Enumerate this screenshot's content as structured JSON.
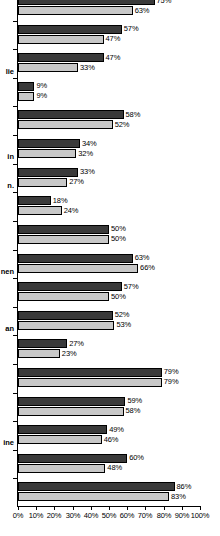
{
  "chart_data": {
    "type": "bar",
    "orientation": "horizontal",
    "title": "",
    "subtitle": "",
    "xlabel": "",
    "ylabel": "",
    "xlim": [
      0,
      100
    ],
    "xticks": [
      0,
      10,
      20,
      30,
      40,
      50,
      60,
      70,
      80,
      90,
      100
    ],
    "xtick_labels": [
      "0%",
      "10%",
      "20%",
      "30%",
      "40%",
      "50%",
      "60%",
      "70%",
      "80%",
      "90%",
      "100%"
    ],
    "grid": false,
    "legend": null,
    "value_label_suffix": "%",
    "colors": {
      "series_0": "#3a3a3a",
      "series_1": "#c8c8c8",
      "axis": "#000000",
      "background": "#ffffff",
      "text": "#000000"
    },
    "note": "Image is cropped on the left and top; category labels are truncated to their trailing fragments and the first group is clipped.",
    "categories": [
      "",
      "",
      "lie",
      "",
      "",
      "in",
      "n.",
      "",
      "",
      "nen",
      "",
      "an",
      "",
      "",
      "",
      "ine",
      "",
      ""
    ],
    "series": [
      {
        "name": "series-dark",
        "color": "#3a3a3a",
        "values": [
          75,
          57,
          47,
          9,
          58,
          34,
          33,
          18,
          50,
          63,
          57,
          52,
          27,
          79,
          59,
          49,
          60,
          86
        ]
      },
      {
        "name": "series-light",
        "color": "#c8c8c8",
        "values": [
          63,
          47,
          33,
          9,
          52,
          32,
          27,
          24,
          50,
          66,
          50,
          53,
          23,
          79,
          58,
          46,
          48,
          83
        ]
      }
    ],
    "value_labels": [
      [
        "75%",
        "63%"
      ],
      [
        "57%",
        "47%"
      ],
      [
        "47%",
        "33%"
      ],
      [
        "9%",
        "9%"
      ],
      [
        "58%",
        "52%"
      ],
      [
        "34%",
        "32%"
      ],
      [
        "33%",
        "27%"
      ],
      [
        "18%",
        "24%"
      ],
      [
        "50%",
        "50%"
      ],
      [
        "63%",
        "66%"
      ],
      [
        "57%",
        "50%"
      ],
      [
        "52%",
        "53%"
      ],
      [
        "27%",
        "23%"
      ],
      [
        "79%",
        "79%"
      ],
      [
        "59%",
        "58%"
      ],
      [
        "49%",
        "46%"
      ],
      [
        "60%",
        "48%"
      ],
      [
        "86%",
        "83%"
      ]
    ]
  }
}
